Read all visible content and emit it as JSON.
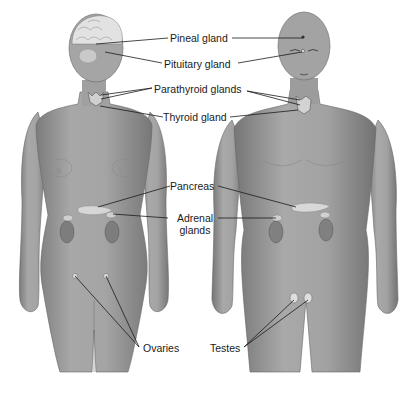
{
  "diagram": {
    "figures": [
      {
        "name": "female",
        "label": ""
      },
      {
        "name": "male",
        "label": ""
      }
    ],
    "labels": {
      "pineal": "Pineal gland",
      "pituitary": "Pituitary gland",
      "parathyroid": "Parathyroid glands",
      "thyroid": "Thyroid gland",
      "pancreas": "Pancreas",
      "adrenal_1": "Adrenal",
      "adrenal_2": "glands",
      "ovaries": "Ovaries",
      "testes": "Testes"
    },
    "colors": {
      "skin": "#9a9a9a",
      "skin_light": "#b9b9b9",
      "skin_dark": "#6e6e6e",
      "gland": "#d8d8d8",
      "kidney": "#7d7d7d",
      "leader_line": "#1a1a1a",
      "background": "#ffffff"
    }
  }
}
